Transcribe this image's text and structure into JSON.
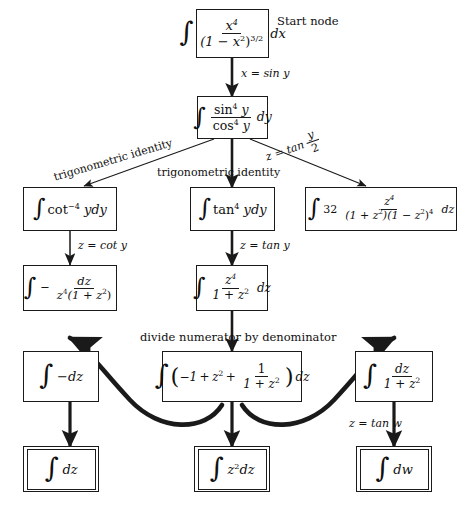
{
  "diagram": {
    "annotations": {
      "start_node": "Start node",
      "divide": "divide numerator by denominator"
    },
    "colors": {
      "background": "#ffffff",
      "stroke": "#1a1a1a",
      "text": "#101010"
    },
    "nodes": {
      "start": {
        "id": "start",
        "label": "integral of x^4 over (1-x^2)^(3/2) dx",
        "parts": {
          "numerator": "x",
          "numerator_exp": "4",
          "den_open": "(1 − x",
          "den_sq": "2",
          "den_close": ")",
          "den_exp": "3/2",
          "differential": "dx"
        }
      },
      "sincos": {
        "id": "sincos",
        "label": "integral of sin^4 y over cos^4 y dy",
        "parts": {
          "num_fn": "sin",
          "num_exp": "4",
          "num_var": "y",
          "den_fn": "cos",
          "den_exp": "4",
          "den_var": "y",
          "differential": "dy"
        }
      },
      "cot": {
        "id": "cot",
        "label": "integral of cot^-4 y dy",
        "parts": {
          "fn": "cot",
          "exp": "−4",
          "var": "y",
          "differential": "dy"
        }
      },
      "tan": {
        "id": "tan",
        "label": "integral of tan^4 y dy",
        "parts": {
          "fn": "tan",
          "exp": "4",
          "var": "y",
          "differential": "dy"
        }
      },
      "weier": {
        "id": "weier",
        "label": "integral of 32 z^4 over (1+z^2)(1-z^2)^4 dz",
        "parts": {
          "coef": "32",
          "numerator": "z",
          "numerator_exp": "4",
          "den_a": "(1 + z",
          "den_a_exp": "2",
          "den_b": ")(1 − z",
          "den_b_exp": "2",
          "den_b_close": ")",
          "den_b_pow": "4",
          "differential": "dz"
        }
      },
      "cotsub": {
        "id": "cotsub",
        "label": "integral of minus dz over z^4 (1+z^2)",
        "parts": {
          "minus": "−",
          "numerator": "dz",
          "den_var": "z",
          "den_exp": "4",
          "den_rest": "(1 + z",
          "den_rest_exp": "2",
          "den_rest_close": ")"
        }
      },
      "tansub": {
        "id": "tansub",
        "label": "integral of z^4 over 1+z^2 dz",
        "parts": {
          "numerator": "z",
          "numerator_exp": "4",
          "den_a": "1 + z",
          "den_exp": "2",
          "differential": "dz"
        }
      },
      "negdz": {
        "id": "negdz",
        "label": "integral of minus dz",
        "parts": {
          "body": "−dz"
        }
      },
      "expanded": {
        "id": "expanded",
        "label": "integral of (-1 + z^2 + 1/(1+z^2)) dz",
        "parts": {
          "t1": "−1",
          "plus1": "+",
          "t2": "z",
          "t2_exp": "2",
          "plus2": "+",
          "f_num": "1",
          "f_den": "1 + z",
          "f_den_exp": "2",
          "differential": "dz"
        }
      },
      "arctan": {
        "id": "arctan",
        "label": "integral of dz over 1+z^2",
        "parts": {
          "numerator": "dz",
          "den_a": "1 + z",
          "den_exp": "2"
        }
      },
      "dz": {
        "id": "dz",
        "terminal": true,
        "label": "integral of dz",
        "parts": {
          "body": "dz"
        }
      },
      "z2dz": {
        "id": "z2dz",
        "terminal": true,
        "label": "integral of z^2 dz",
        "parts": {
          "var": "z",
          "exp": "2",
          "differential": "dz"
        }
      },
      "dw": {
        "id": "dw",
        "terminal": true,
        "label": "integral of dw",
        "parts": {
          "body": "dw"
        }
      }
    },
    "edges": {
      "start_to_sincos": {
        "label": "x = sin y",
        "from": "start",
        "to": "sincos"
      },
      "sincos_to_cot": {
        "label": "trigonometric identity",
        "from": "sincos",
        "to": "cot"
      },
      "sincos_to_tan": {
        "label": "trigonometric identity",
        "from": "sincos",
        "to": "tan"
      },
      "sincos_to_weier": {
        "label_a": "z = tan",
        "label_num": "y",
        "label_den": "2",
        "from": "sincos",
        "to": "weier"
      },
      "cot_to_cotsub": {
        "label": "z = cot y",
        "from": "cot",
        "to": "cotsub"
      },
      "tan_to_tansub": {
        "label": "z = tan y",
        "from": "tan",
        "to": "tansub"
      },
      "tansub_to_expanded": {
        "label": "divide numerator by denominator",
        "from": "tansub",
        "to": "expanded"
      },
      "expanded_to_negdz": {
        "label": "",
        "from": "expanded",
        "to": "negdz"
      },
      "expanded_to_arctan": {
        "label": "",
        "from": "expanded",
        "to": "arctan"
      },
      "negdz_to_dz": {
        "label": "",
        "from": "negdz",
        "to": "dz"
      },
      "expanded_to_z2dz": {
        "label": "",
        "from": "expanded",
        "to": "z2dz"
      },
      "arctan_to_dw": {
        "label": "z = tan w",
        "from": "arctan",
        "to": "dw"
      }
    }
  }
}
